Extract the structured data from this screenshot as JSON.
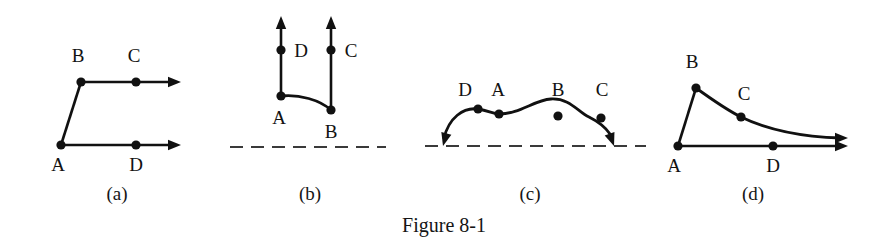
{
  "figure": {
    "caption": "Figure 8-1",
    "caption_x": 444,
    "caption_y": 232,
    "width": 889,
    "height": 244,
    "background": "#ffffff",
    "ink_color": "#111111",
    "dash_color": "#3a3a3a"
  },
  "panels": [
    {
      "id": "panel-a",
      "label": "(a)",
      "label_x": 117,
      "label_y": 200,
      "description": "Two rightward horizontal rays: lower ray starts at A through D, upper ray starts at B through C, with a short segment joining A up to B.",
      "vertices": [
        {
          "name": "A",
          "x": 61,
          "y": 145,
          "label_x": 58,
          "label_y": 171
        },
        {
          "name": "B",
          "x": 81,
          "y": 82,
          "label_x": 78,
          "label_y": 62
        },
        {
          "name": "C",
          "x": 136,
          "y": 82,
          "label_x": 134,
          "label_y": 62
        },
        {
          "name": "D",
          "x": 136,
          "y": 145,
          "label_x": 136,
          "label_y": 171
        }
      ],
      "paths": [
        {
          "name": "segment-a-to-b",
          "d": "M 61 145 L 81 82",
          "kind": "solid"
        },
        {
          "name": "ray-b-through-c",
          "d": "M 81 82 L 174 82",
          "kind": "solid"
        },
        {
          "name": "ray-a-through-d",
          "d": "M 61 145 L 174 145",
          "kind": "solid"
        }
      ],
      "arrows": [
        {
          "name": "arrowhead-upper-right",
          "x": 181,
          "y": 82,
          "angle": 0
        },
        {
          "name": "arrowhead-lower-right",
          "x": 181,
          "y": 145,
          "angle": 0
        }
      ],
      "dashed_lines": []
    },
    {
      "id": "panel-b",
      "label": "(b)",
      "label_x": 310,
      "label_y": 200,
      "description": "Two upward vertical rays rising from a dashed baseline region: left ray from A through D, right ray from B through C, joined by a concave curve from A down to B.",
      "vertices": [
        {
          "name": "D",
          "x": 281,
          "y": 50,
          "label_x": 301,
          "label_y": 57
        },
        {
          "name": "A",
          "x": 281,
          "y": 96,
          "label_x": 279,
          "label_y": 124
        },
        {
          "name": "C",
          "x": 331,
          "y": 50,
          "label_x": 351,
          "label_y": 57
        },
        {
          "name": "B",
          "x": 331,
          "y": 110,
          "label_x": 331,
          "label_y": 138
        }
      ],
      "paths": [
        {
          "name": "ray-a-through-d",
          "d": "M 281 96 L 281 24",
          "kind": "solid"
        },
        {
          "name": "ray-b-through-c",
          "d": "M 331 110 L 331 24",
          "kind": "solid"
        },
        {
          "name": "curve-a-to-b",
          "d": "M 281 96 C 299 94 320 100 331 110",
          "kind": "curve"
        }
      ],
      "arrows": [
        {
          "name": "arrowhead-left-up",
          "x": 281,
          "y": 16,
          "angle": -90
        },
        {
          "name": "arrowhead-right-up",
          "x": 331,
          "y": 16,
          "angle": -90
        }
      ],
      "dashed_lines": [
        {
          "name": "baseline-dashed",
          "x1": 230,
          "y1": 147,
          "x2": 386,
          "y2": 147
        }
      ]
    },
    {
      "id": "panel-c",
      "label": "(c)",
      "label_x": 530,
      "label_y": 200,
      "description": "A broad hump above a dashed baseline, rising from the baseline at the left with a downward arrow and descending back to the baseline at the right with a downward arrow; points D, A, B, C lie along the hump.",
      "vertices": [
        {
          "name": "D",
          "x": 478,
          "y": 109,
          "label_x": 465,
          "label_y": 96
        },
        {
          "name": "A",
          "x": 499,
          "y": 114,
          "label_x": 498,
          "label_y": 96
        },
        {
          "name": "B",
          "x": 558,
          "y": 116,
          "label_x": 558,
          "label_y": 96
        },
        {
          "name": "C",
          "x": 601,
          "y": 118,
          "label_x": 602,
          "label_y": 96
        }
      ],
      "paths": [
        {
          "name": "hump-curve",
          "d": "M 444 138 C 449 118 463 107 478 109 C 489 111 494 114 499 114 C 520 114 534 100 551 99 C 570 98 578 112 589 117 C 597 121 604 125 610 134",
          "kind": "curve"
        }
      ],
      "arrows": [
        {
          "name": "arrowhead-left-down",
          "x": 443,
          "y": 146,
          "angle": 105
        },
        {
          "name": "arrowhead-right-down",
          "x": 614,
          "y": 146,
          "angle": 70
        }
      ],
      "dashed_lines": [
        {
          "name": "baseline-dashed",
          "x1": 425,
          "y1": 146,
          "x2": 646,
          "y2": 146
        }
      ]
    },
    {
      "id": "panel-d",
      "label": "(d)",
      "label_x": 753,
      "label_y": 200,
      "description": "A rightward horizontal ray from A through D, and a curve rising steeply from A to a peak at B then decaying through C toward a rightward arrow.",
      "vertices": [
        {
          "name": "A",
          "x": 678,
          "y": 146,
          "label_x": 674,
          "label_y": 172
        },
        {
          "name": "B",
          "x": 696,
          "y": 88,
          "label_x": 692,
          "label_y": 68
        },
        {
          "name": "C",
          "x": 741,
          "y": 117,
          "label_x": 744,
          "label_y": 100
        },
        {
          "name": "D",
          "x": 773,
          "y": 146,
          "label_x": 773,
          "label_y": 172
        }
      ],
      "paths": [
        {
          "name": "segment-a-to-b",
          "d": "M 678 146 L 696 88",
          "kind": "solid"
        },
        {
          "name": "decay-curve-b-through-c",
          "d": "M 696 88 C 714 101 727 110 741 117 C 770 131 806 137 841 138",
          "kind": "curve"
        },
        {
          "name": "ray-a-through-d",
          "d": "M 678 146 L 841 146",
          "kind": "solid"
        }
      ],
      "arrows": [
        {
          "name": "arrowhead-curve-right",
          "x": 848,
          "y": 138,
          "angle": 0
        },
        {
          "name": "arrowhead-line-right",
          "x": 848,
          "y": 146,
          "angle": 0
        }
      ],
      "dashed_lines": []
    }
  ],
  "style": {
    "dot_radius": 4.6,
    "arrow_length": 13,
    "arrow_half_width": 5.2
  }
}
